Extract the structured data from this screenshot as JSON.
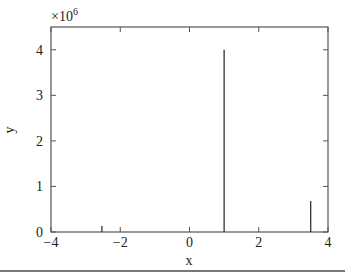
{
  "chart_data": {
    "type": "bar",
    "style": "stem",
    "title": "",
    "xlabel": "x",
    "ylabel": "y",
    "y_multiplier": "×10^6",
    "y_multiplier_base": "×10",
    "y_multiplier_exp": "6",
    "xlim": [
      -4,
      4
    ],
    "ylim": [
      0,
      4.5
    ],
    "xticks": [
      -4,
      -2,
      0,
      2,
      4
    ],
    "xtick_labels": [
      "−4",
      "−2",
      "0",
      "2",
      "4"
    ],
    "yticks": [
      0,
      1,
      2,
      3,
      4
    ],
    "ytick_labels": [
      "0",
      "1",
      "2",
      "3",
      "4"
    ],
    "grid": false,
    "legend": null,
    "series": [
      {
        "name": "y",
        "x": [
          -2.53,
          1.0,
          3.5
        ],
        "values": [
          0.13,
          4.0,
          0.68
        ]
      }
    ],
    "colors": {
      "line": "#333333",
      "axis": "#555555"
    }
  }
}
